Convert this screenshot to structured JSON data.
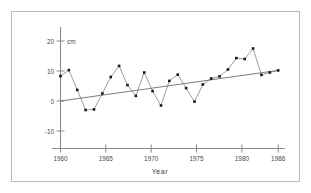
{
  "figure": {
    "frame_color": "#b9b9b9",
    "background": "#ffffff"
  },
  "chart_data": {
    "type": "line",
    "title": "",
    "subtitle": "",
    "xlabel": "Year",
    "ylabel": "",
    "yunit": "cm",
    "xlim": [
      1960,
      1986
    ],
    "ylim": [
      -13,
      21
    ],
    "grid": false,
    "legend": null,
    "xticks": [
      1960,
      1965,
      1970,
      1975,
      1980,
      1986
    ],
    "xtick_labels": [
      "1960",
      "1965",
      "1970",
      "1975",
      "1980",
      "1986"
    ],
    "yticks": [
      -10,
      0,
      10,
      20
    ],
    "ytick_labels": [
      "-10",
      "0",
      "10",
      "20"
    ],
    "series": [
      {
        "name": "annual-value",
        "marker": "filled-square",
        "color": "#1a1a1a",
        "line_color": "#8c8c8c",
        "x": [
          1960,
          1961,
          1962,
          1963,
          1964,
          1965,
          1966,
          1967,
          1968,
          1969,
          1970,
          1971,
          1972,
          1973,
          1974,
          1975,
          1976,
          1977,
          1978,
          1979,
          1980,
          1981,
          1982,
          1983,
          1984,
          1985,
          1986
        ],
        "values": [
          8.3,
          10.3,
          3.7,
          -3.0,
          -2.8,
          2.5,
          8.0,
          11.7,
          5.3,
          1.7,
          9.5,
          3.3,
          -1.5,
          6.7,
          8.8,
          4.3,
          -0.2,
          5.5,
          7.5,
          8.2,
          10.5,
          14.3,
          14.0,
          17.5,
          8.7,
          9.5,
          10.2
        ]
      }
    ],
    "trend_line": {
      "name": "linear-trend",
      "color": "#6e6e6e",
      "x": [
        1960,
        1986
      ],
      "values": [
        0.0,
        10.2
      ]
    }
  }
}
